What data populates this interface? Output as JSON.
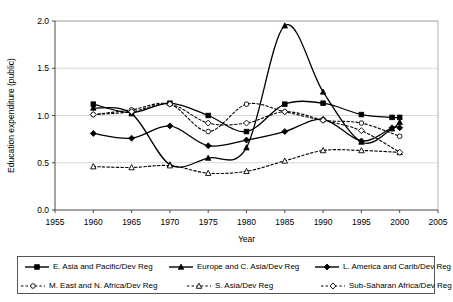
{
  "chart_data": {
    "type": "line",
    "title": "",
    "xlabel": "Year",
    "ylabel": "Education expenditure (public)",
    "xlim": [
      1955,
      2005
    ],
    "ylim": [
      0.0,
      2.0
    ],
    "xticks": [
      1955,
      1960,
      1965,
      1970,
      1975,
      1980,
      1985,
      1990,
      1995,
      2000,
      2005
    ],
    "yticks": [
      0.0,
      0.5,
      1.0,
      1.5,
      2.0
    ],
    "xtick_labels": [
      "1955",
      "1960",
      "1965",
      "1970",
      "1975",
      "1980",
      "1985",
      "1990",
      "1995",
      "2000",
      "2005"
    ],
    "ytick_labels": [
      "0.0",
      "0.5",
      "1.0",
      "1.5",
      "2.0"
    ],
    "grid": "horizontal",
    "legend_position": "bottom",
    "x": [
      1960,
      1965,
      1970,
      1975,
      1980,
      1985,
      1990,
      1995,
      2000
    ],
    "series": [
      {
        "name": "E. Asia and Pacific/Dev Reg",
        "marker": "filled-square",
        "line": "solid",
        "color": "#000000",
        "values": [
          1.12,
          1.03,
          1.13,
          1.0,
          0.83,
          1.12,
          1.13,
          1.01,
          0.98
        ]
      },
      {
        "name": "Europe and C. Asia/Dev Reg",
        "marker": "filled-triangle",
        "line": "solid",
        "color": "#000000",
        "values": [
          1.08,
          1.02,
          0.48,
          0.55,
          0.66,
          1.95,
          1.25,
          0.72,
          0.93
        ]
      },
      {
        "name": "L. America and Carib/Dev Reg",
        "marker": "filled-diamond",
        "line": "solid",
        "color": "#000000",
        "values": [
          0.81,
          0.76,
          0.89,
          0.68,
          0.74,
          0.83,
          0.96,
          0.73,
          0.87
        ]
      },
      {
        "name": "M. East and N. Africa/Dev Reg",
        "marker": "open-circle",
        "line": "dashed",
        "color": "#000000",
        "values": [
          1.01,
          1.06,
          1.12,
          0.83,
          1.12,
          1.04,
          0.95,
          0.92,
          0.78
        ]
      },
      {
        "name": "S. Asia/Dev Reg",
        "marker": "open-triangle",
        "line": "dashed",
        "color": "#000000",
        "values": [
          0.46,
          0.45,
          0.47,
          0.39,
          0.41,
          0.52,
          0.63,
          0.63,
          0.61
        ]
      },
      {
        "name": "Sub-Saharan Africa/Dev Reg",
        "marker": "open-diamond",
        "line": "dashed",
        "color": "#000000",
        "values": [
          1.01,
          1.04,
          1.12,
          0.92,
          0.92,
          1.04,
          0.95,
          0.84,
          0.61
        ]
      }
    ],
    "extra_points": [
      {
        "series": "E. Asia and Pacific/Dev Reg",
        "x": 1999,
        "y": 0.98
      },
      {
        "series": "Europe and C. Asia/Dev Reg",
        "x": 1999,
        "y": 0.86
      },
      {
        "series": "L. America and Carib/Dev Reg",
        "x": 1999,
        "y": 0.87
      }
    ]
  },
  "legend": {
    "rows": [
      [
        {
          "label": "E. Asia and Pacific/Dev Reg",
          "marker": "filled-square",
          "line": "solid"
        },
        {
          "label": "Europe and C. Asia/Dev Reg",
          "marker": "filled-triangle",
          "line": "solid"
        },
        {
          "label": "L. America and Carib/Dev Reg",
          "marker": "filled-diamond",
          "line": "solid"
        }
      ],
      [
        {
          "label": "M. East and N. Africa/Dev Reg",
          "marker": "open-circle",
          "line": "dashed"
        },
        {
          "label": "S. Asia/Dev Reg",
          "marker": "open-triangle",
          "line": "dashed"
        },
        {
          "label": "Sub-Saharan Africa/Dev Reg",
          "marker": "open-diamond",
          "line": "dashed"
        }
      ]
    ]
  }
}
